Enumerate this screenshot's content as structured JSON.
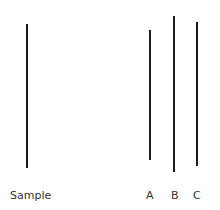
{
  "diagram": {
    "line_color": "#1a1a1a",
    "label_color": "#333333",
    "lines": [
      {
        "id": "sample",
        "label": "Sample",
        "x": 26,
        "y1": 24,
        "y2": 168
      },
      {
        "id": "A",
        "label": "A",
        "x": 149,
        "y1": 30,
        "y2": 160
      },
      {
        "id": "B",
        "label": "B",
        "x": 173,
        "y1": 16,
        "y2": 172
      },
      {
        "id": "C",
        "label": "C",
        "x": 196,
        "y1": 22,
        "y2": 166
      }
    ]
  },
  "labels": {
    "sample": "Sample",
    "a": "A",
    "b": "B",
    "c": "C"
  }
}
